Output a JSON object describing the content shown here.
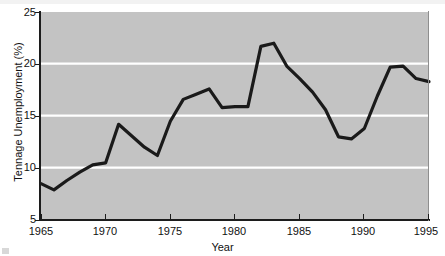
{
  "chart_data": {
    "type": "line",
    "title": "",
    "xlabel": "Year",
    "ylabel": "Tennage Unemployment (%)",
    "xlim": [
      1965,
      1995
    ],
    "ylim": [
      5,
      25
    ],
    "grid": true,
    "grid_orientation": "horizontal",
    "grid_color": "#ffffff",
    "plot_background": "#c3c3c3",
    "line_color": "#1a1a1a",
    "line_width": 3,
    "legend": null,
    "xticks": [
      1965,
      1970,
      1975,
      1980,
      1985,
      1990,
      1995
    ],
    "xtick_labels": [
      "1965",
      "1970",
      "1975",
      "1980",
      "1985",
      "1990",
      "1995"
    ],
    "yticks": [
      5,
      10,
      15,
      20,
      25
    ],
    "ytick_labels": [
      "5",
      "10",
      "15",
      "20",
      "25"
    ],
    "x": [
      1965,
      1966,
      1967,
      1968,
      1969,
      1970,
      1971,
      1972,
      1973,
      1974,
      1975,
      1976,
      1977,
      1978,
      1979,
      1980,
      1981,
      1982,
      1983,
      1984,
      1985,
      1986,
      1987,
      1988,
      1989,
      1990,
      1991,
      1992,
      1993,
      1994,
      1995
    ],
    "values": [
      8.5,
      7.9,
      8.8,
      9.6,
      10.3,
      10.5,
      14.2,
      13.1,
      12.0,
      11.2,
      14.5,
      16.6,
      17.1,
      17.6,
      15.8,
      15.9,
      15.9,
      21.7,
      22.0,
      19.8,
      18.6,
      17.3,
      15.6,
      13.0,
      12.8,
      13.8,
      16.9,
      19.7,
      19.8,
      18.6,
      18.3
    ],
    "series_name": "Teenage Unemployment"
  },
  "axes": {
    "x_title": "Year",
    "y_title": "Tennage Unemployment (%)"
  }
}
